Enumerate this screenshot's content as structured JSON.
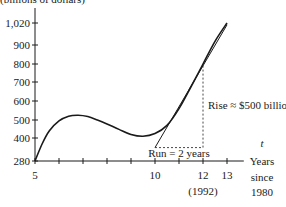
{
  "chart_data": {
    "type": "line",
    "title": "(billions of dollars)",
    "xlabel_var": "t",
    "xlabel_lines": [
      "Years",
      "since",
      "1980"
    ],
    "ylabel": "",
    "xlim": [
      5,
      13.7
    ],
    "ylim": [
      280,
      1060
    ],
    "x_ticks": [
      5,
      6,
      7,
      8,
      9,
      10,
      11,
      12,
      13
    ],
    "x_tick_labels": [
      {
        "x": 5,
        "label": "5"
      },
      {
        "x": 10,
        "label": "10"
      },
      {
        "x": 12,
        "label": "12"
      },
      {
        "x": 13,
        "label": "13"
      }
    ],
    "x_sub_label": {
      "x": 12,
      "label": "(1992)"
    },
    "y_ticks": [
      {
        "y": 280,
        "label": "280"
      },
      {
        "y": 400,
        "label": "400"
      },
      {
        "y": 500,
        "label": "500"
      },
      {
        "y": 600,
        "label": "600"
      },
      {
        "y": 700,
        "label": "700"
      },
      {
        "y": 800,
        "label": "800"
      },
      {
        "y": 900,
        "label": "900"
      },
      {
        "y": 1020,
        "label": "1,020"
      }
    ],
    "series": [
      {
        "name": "curve",
        "x": [
          5,
          5.3,
          5.6,
          6.0,
          6.4,
          6.8,
          7.2,
          7.6,
          8.0,
          8.5,
          9.0,
          9.5,
          10.0,
          10.5,
          11.0,
          11.5,
          12.0,
          12.5,
          13.0
        ],
        "y": [
          280,
          370,
          440,
          495,
          520,
          525,
          518,
          500,
          478,
          448,
          420,
          410,
          425,
          470,
          560,
          675,
          800,
          920,
          1020
        ]
      }
    ],
    "tangent": {
      "x0": 10,
      "y0": 350,
      "x1": 13,
      "y1": 1010
    },
    "run_segment": {
      "x0": 10,
      "x1": 12,
      "y": 350
    },
    "rise_segment": {
      "x": 12,
      "y0": 350,
      "y1": 800
    },
    "annotations": {
      "run": "Run = 2 years",
      "rise": "Rise ≈ $500 billion"
    }
  }
}
